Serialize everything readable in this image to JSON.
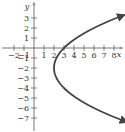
{
  "chart_data": {
    "type": "line",
    "title": "",
    "xlabel": "x",
    "ylabel": "y",
    "xlim": [
      -2.5,
      9
    ],
    "ylim": [
      -8.2,
      4.5
    ],
    "grid": false,
    "x_ticks": [
      -2,
      -1,
      1,
      2,
      3,
      4,
      5,
      6,
      7,
      8
    ],
    "y_ticks": [
      3,
      2,
      1,
      -1,
      -2,
      -3,
      -4,
      -5,
      -6,
      -7
    ],
    "x_tick_labels": [
      "−2",
      "−1",
      "1",
      "2",
      "3",
      "4",
      "5",
      "6",
      "7",
      "8"
    ],
    "y_tick_labels": [
      "3",
      "2",
      "1",
      "−1",
      "−2",
      "−3",
      "−4",
      "−5",
      "−6",
      "−7"
    ],
    "series": [
      {
        "name": "parabola opening right",
        "equation": "x = (y + 2)^2 / 4 + 2",
        "vertex": [
          2,
          -2
        ],
        "points": [
          [
            8.9,
            3.3
          ],
          [
            6,
            2
          ],
          [
            4.25,
            1
          ],
          [
            3,
            0
          ],
          [
            2.25,
            -1
          ],
          [
            2,
            -2
          ],
          [
            2.25,
            -3
          ],
          [
            3,
            -4
          ],
          [
            4.25,
            -5
          ],
          [
            6,
            -6
          ],
          [
            8.25,
            -7
          ],
          [
            8.9,
            -7.3
          ]
        ],
        "arrows_at_ends": true,
        "color": "#444444"
      }
    ]
  },
  "axes": {
    "x_label": "x",
    "y_label": "y"
  }
}
